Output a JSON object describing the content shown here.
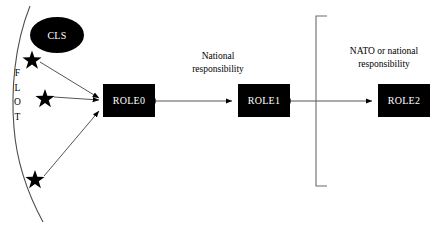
{
  "diagram": {
    "flot": {
      "label_letters": [
        "F",
        "L",
        "O",
        "T"
      ],
      "label_full": "FLOT"
    },
    "casualties": [
      {
        "name": "casualty-star-1"
      },
      {
        "name": "casualty-star-2"
      },
      {
        "name": "casualty-star-3"
      }
    ],
    "nodes": {
      "cls": "CLS",
      "role0": "ROLE0",
      "role1": "ROLE1",
      "role2": "ROLE2"
    },
    "captions": {
      "national": [
        "National",
        "responsibility"
      ],
      "nato": [
        "NATO or national",
        "responsibility"
      ]
    },
    "colors": {
      "node_fill": "#000000",
      "node_text": "#ffffff",
      "line": "#555555",
      "background": "#ffffff",
      "text": "#000000"
    }
  }
}
